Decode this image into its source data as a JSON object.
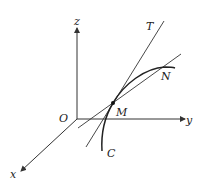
{
  "diagram": {
    "type": "3d-curve-tangent",
    "axes": {
      "x_label": "x",
      "y_label": "y",
      "z_label": "z",
      "origin_label": "O"
    },
    "curve_label": "C",
    "tangent_label": "T",
    "points": {
      "M": "M",
      "N": "N"
    },
    "colors": {
      "stroke": "#333333",
      "background": "#ffffff"
    }
  }
}
